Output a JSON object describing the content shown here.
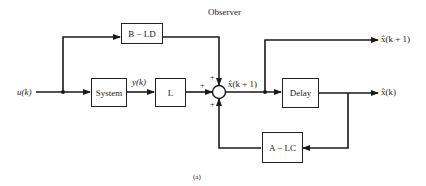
{
  "title": "Observer",
  "caption": "(a)",
  "input_label": "u(k)",
  "blocks": {
    "b_ld": "B − LD",
    "system": "System",
    "l": "L",
    "delay": "Delay",
    "a_lc": "A − LC"
  },
  "signals": {
    "y": "y(k)",
    "xhat_next_mid": "x̂(k + 1)",
    "xhat_next_out": "x̂(k + 1)",
    "xhat_out": "x̂(k)"
  },
  "summing_junction": {
    "signs": [
      "+",
      "+",
      "+"
    ]
  },
  "colors": {
    "line": "#1a1a1a",
    "background": "#ffffff"
  }
}
